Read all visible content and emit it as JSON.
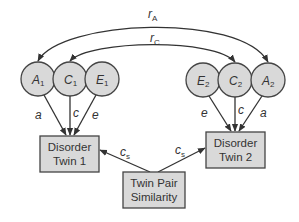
{
  "diagram": {
    "type": "ACE twin model path diagram",
    "latent_nodes": [
      {
        "id": "A1",
        "letter": "A",
        "sub": "1",
        "cx": 38,
        "cy": 79
      },
      {
        "id": "C1",
        "letter": "C",
        "sub": "1",
        "cx": 70,
        "cy": 79
      },
      {
        "id": "E1",
        "letter": "E",
        "sub": "1",
        "cx": 102,
        "cy": 79
      },
      {
        "id": "E2",
        "letter": "E",
        "sub": "2",
        "cx": 203,
        "cy": 80
      },
      {
        "id": "C2",
        "letter": "C",
        "sub": "2",
        "cx": 235,
        "cy": 80
      },
      {
        "id": "A2",
        "letter": "A",
        "sub": "2",
        "cx": 268,
        "cy": 80
      }
    ],
    "observed_nodes": [
      {
        "id": "twin1",
        "line1": "Disorder",
        "line2": "Twin 1"
      },
      {
        "id": "twin2",
        "line1": "Disorder",
        "line2": "Twin 2"
      },
      {
        "id": "similarity",
        "line1": "Twin Pair",
        "line2": "Similarity"
      }
    ],
    "correlations": [
      {
        "letter": "r",
        "sub": "A",
        "from": "A1",
        "to": "A2"
      },
      {
        "letter": "r",
        "sub": "C",
        "from": "C1",
        "to": "C2"
      }
    ],
    "paths": {
      "a1": "a",
      "c1": "c",
      "e1": "e",
      "e2": "e",
      "c2": "c",
      "a2": "a",
      "cs_letter": "c",
      "cs_sub": "s"
    }
  }
}
